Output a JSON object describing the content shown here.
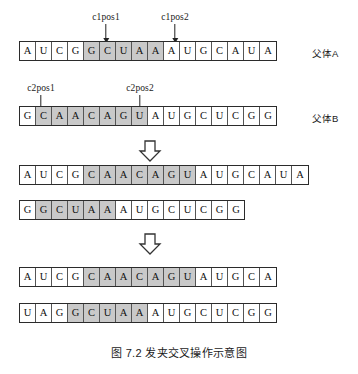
{
  "figure": {
    "caption": "图 7.2  发夹交叉操作示意图",
    "caption_number": "图 7.2",
    "caption_title": "发夹交叉操作示意图"
  },
  "pointers": {
    "c1pos1": "c1pos1",
    "c1pos2": "c1pos2",
    "c2pos1": "c2pos1",
    "c2pos2": "c2pos2"
  },
  "side_labels": {
    "parent_a": "父体A",
    "parent_b": "父体B"
  },
  "colors": {
    "shade": "#c9c9c9",
    "cell_bg": "#ffffff",
    "outline": "#2b2b2b",
    "text": "#111111"
  },
  "rows": [
    {
      "id": "parent-a",
      "label": "父体A",
      "bases": [
        "A",
        "U",
        "C",
        "G",
        "G",
        "C",
        "U",
        "A",
        "A",
        "A",
        "U",
        "G",
        "C",
        "A",
        "U",
        "A"
      ],
      "shaded": [
        false,
        false,
        false,
        false,
        true,
        true,
        true,
        true,
        true,
        false,
        false,
        false,
        false,
        false,
        false,
        false
      ]
    },
    {
      "id": "parent-b",
      "label": "父体B",
      "bases": [
        "G",
        "C",
        "A",
        "A",
        "C",
        "A",
        "G",
        "U",
        "A",
        "U",
        "G",
        "C",
        "U",
        "C",
        "G",
        "G"
      ],
      "shaded": [
        false,
        true,
        true,
        true,
        true,
        true,
        true,
        true,
        false,
        false,
        false,
        false,
        false,
        false,
        false,
        false
      ]
    },
    {
      "id": "child-1",
      "label": "",
      "bases": [
        "A",
        "U",
        "C",
        "G",
        "C",
        "A",
        "A",
        "C",
        "A",
        "G",
        "U",
        "A",
        "U",
        "G",
        "C",
        "A",
        "U",
        "A"
      ],
      "shaded": [
        false,
        false,
        false,
        false,
        true,
        true,
        true,
        true,
        true,
        true,
        true,
        false,
        false,
        false,
        false,
        false,
        false,
        false
      ]
    },
    {
      "id": "child-2",
      "label": "",
      "bases": [
        "G",
        "G",
        "C",
        "U",
        "A",
        "A",
        "A",
        "U",
        "G",
        "C",
        "U",
        "C",
        "G",
        "G"
      ],
      "shaded": [
        false,
        true,
        true,
        true,
        true,
        true,
        false,
        false,
        false,
        false,
        false,
        false,
        false,
        false
      ]
    },
    {
      "id": "child-3",
      "label": "",
      "bases": [
        "A",
        "U",
        "C",
        "G",
        "C",
        "A",
        "A",
        "C",
        "A",
        "G",
        "U",
        "A",
        "U",
        "G",
        "C",
        "A"
      ],
      "shaded": [
        false,
        false,
        false,
        false,
        true,
        true,
        true,
        true,
        true,
        true,
        true,
        false,
        false,
        false,
        false,
        false
      ]
    },
    {
      "id": "child-4",
      "label": "",
      "bases": [
        "U",
        "A",
        "G",
        "G",
        "C",
        "U",
        "A",
        "A",
        "A",
        "U",
        "G",
        "C",
        "U",
        "C",
        "G",
        "G"
      ],
      "shaded": [
        false,
        false,
        false,
        true,
        true,
        true,
        true,
        true,
        false,
        false,
        false,
        false,
        false,
        false,
        false,
        false
      ]
    }
  ]
}
